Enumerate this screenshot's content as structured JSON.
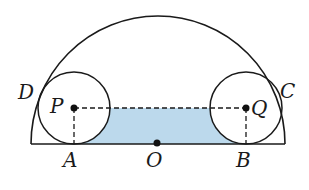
{
  "diagram": {
    "type": "geometry",
    "colors": {
      "stroke": "#1a1a1a",
      "shade": "#bcd9ec",
      "background": "#ffffff"
    },
    "labels": {
      "D": "D",
      "C": "C",
      "P": "P",
      "Q": "Q",
      "A": "A",
      "B": "B",
      "O": "O"
    }
  }
}
